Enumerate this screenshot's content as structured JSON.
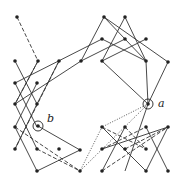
{
  "diagram": {
    "type": "graph",
    "labels": {
      "a": "a",
      "b": "b"
    },
    "colors": {
      "line": "#333333",
      "node": "#222222",
      "background": "#ffffff"
    },
    "nodes": [
      {
        "id": "n1",
        "x": 17,
        "y": 17
      },
      {
        "id": "n2",
        "x": 38,
        "y": 61
      },
      {
        "id": "n3",
        "x": 15,
        "y": 61
      },
      {
        "id": "n4",
        "x": 15,
        "y": 83
      },
      {
        "id": "n5",
        "x": 37,
        "y": 83
      },
      {
        "id": "n6",
        "x": 59,
        "y": 61
      },
      {
        "id": "n7",
        "x": 81,
        "y": 61
      },
      {
        "id": "n8",
        "x": 104,
        "y": 17
      },
      {
        "id": "n9",
        "x": 125,
        "y": 17
      },
      {
        "id": "n10",
        "x": 102,
        "y": 39
      },
      {
        "id": "n11",
        "x": 125,
        "y": 39
      },
      {
        "id": "n12",
        "x": 146,
        "y": 39
      },
      {
        "id": "n13",
        "x": 102,
        "y": 61
      },
      {
        "id": "n14",
        "x": 146,
        "y": 61
      },
      {
        "id": "n15",
        "x": 168,
        "y": 62
      },
      {
        "id": "n16",
        "x": 15,
        "y": 104
      },
      {
        "id": "n17",
        "x": 37,
        "y": 104
      },
      {
        "id": "n18",
        "x": 15,
        "y": 127
      },
      {
        "id": "n19",
        "x": 15,
        "y": 149
      },
      {
        "id": "n20",
        "x": 37,
        "y": 149
      },
      {
        "id": "n21",
        "x": 59,
        "y": 149
      },
      {
        "id": "n22",
        "x": 37,
        "y": 171
      },
      {
        "id": "n23",
        "x": 80,
        "y": 150
      },
      {
        "id": "n24",
        "x": 80,
        "y": 171
      },
      {
        "id": "n25",
        "x": 102,
        "y": 127
      },
      {
        "id": "n26",
        "x": 125,
        "y": 127
      },
      {
        "id": "n27",
        "x": 146,
        "y": 127
      },
      {
        "id": "n28",
        "x": 168,
        "y": 127
      },
      {
        "id": "n29",
        "x": 102,
        "y": 149
      },
      {
        "id": "n30",
        "x": 125,
        "y": 149
      },
      {
        "id": "n31",
        "x": 146,
        "y": 149
      },
      {
        "id": "n32",
        "x": 102,
        "y": 171
      },
      {
        "id": "n33",
        "x": 146,
        "y": 171
      },
      {
        "id": "n34",
        "x": 168,
        "y": 171
      },
      {
        "id": "a",
        "x": 148,
        "y": 104,
        "circled": true,
        "label": "a"
      },
      {
        "id": "b",
        "x": 38,
        "y": 126,
        "circled": true,
        "label": "b"
      }
    ]
  }
}
